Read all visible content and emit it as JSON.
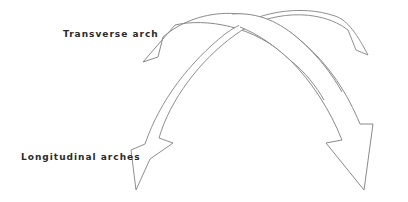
{
  "labels": {
    "transverse": "Transverse arch",
    "longitudinal": "Longitudinal arches"
  },
  "colors": {
    "background": "#ffffff",
    "outline": "#8a8a8a",
    "fill": "#ffffff",
    "text": "#2a2a2a"
  }
}
